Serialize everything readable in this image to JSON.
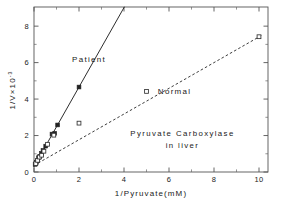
{
  "chart_data": {
    "type": "scatter",
    "title": "",
    "annotation_lines": [
      "Pyruvate Carboxylase",
      "in liver"
    ],
    "xlabel": "1/Pyruvate(mM)",
    "ylabel": "1/V×10",
    "ylabel_exponent": "-3",
    "xlim": [
      0,
      10.4
    ],
    "ylim": [
      0,
      9.05
    ],
    "xticks": [
      0,
      2,
      4,
      6,
      8,
      10
    ],
    "yticks": [
      0,
      2,
      4,
      6,
      8
    ],
    "xtick_labels": [
      "0",
      "2",
      "4",
      "6",
      "8",
      "10"
    ],
    "ytick_labels": [
      "0",
      "2",
      "4",
      "6",
      "8"
    ],
    "minor_xticks": [
      1,
      3,
      5,
      7,
      9
    ],
    "minor_yticks": [
      1,
      3,
      5,
      7
    ],
    "grid": false,
    "frame": "box",
    "legend_position": "inline-annotations",
    "series": [
      {
        "name": "Patient",
        "marker": "filled-square",
        "line_style": "solid",
        "color": "#222222",
        "label_x": 2.45,
        "label_y": 6.05,
        "fit_intercept": 0.3,
        "fit_slope": 2.18,
        "fit_x_range": [
          0,
          4.02
        ],
        "points": [
          {
            "x": 0.05,
            "y": 0.42
          },
          {
            "x": 0.1,
            "y": 0.52
          },
          {
            "x": 0.14,
            "y": 0.62
          },
          {
            "x": 0.2,
            "y": 0.78
          },
          {
            "x": 0.26,
            "y": 0.86
          },
          {
            "x": 0.33,
            "y": 1.02
          },
          {
            "x": 0.4,
            "y": 1.18
          },
          {
            "x": 0.52,
            "y": 1.42
          },
          {
            "x": 0.8,
            "y": 2.08
          },
          {
            "x": 0.92,
            "y": 2.12
          },
          {
            "x": 1.05,
            "y": 2.58
          },
          {
            "x": 2.0,
            "y": 4.66
          }
        ]
      },
      {
        "name": "Normal",
        "marker": "open-square",
        "line_style": "dashed",
        "color": "#333333",
        "label_x": 6.25,
        "label_y": 4.3,
        "fit_intercept": 0.36,
        "fit_slope": 0.705,
        "fit_x_range": [
          0,
          10.15
        ],
        "points": [
          {
            "x": 0.08,
            "y": 0.46
          },
          {
            "x": 0.16,
            "y": 0.64
          },
          {
            "x": 0.24,
            "y": 0.82
          },
          {
            "x": 0.34,
            "y": 0.92
          },
          {
            "x": 0.44,
            "y": 1.14
          },
          {
            "x": 0.6,
            "y": 1.52
          },
          {
            "x": 0.88,
            "y": 2.02
          },
          {
            "x": 2.0,
            "y": 2.68
          },
          {
            "x": 5.0,
            "y": 4.42
          },
          {
            "x": 10.0,
            "y": 7.42
          }
        ]
      }
    ]
  }
}
